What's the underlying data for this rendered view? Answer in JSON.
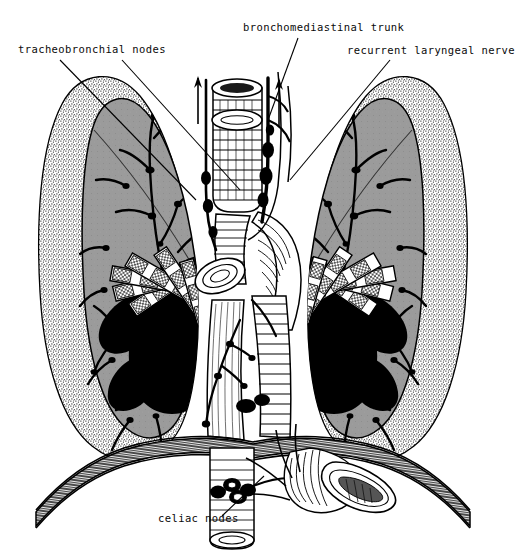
{
  "figure": {
    "kind": "anatomical-line-illustration",
    "view": "anterior coronal section of the thorax",
    "style": "black-and-white pen-and-ink stipple engraving"
  },
  "labels": {
    "tracheobronchial_nodes": "tracheobronchial nodes",
    "bronchomediastinal_trunk": "bronchomediastinal trunk",
    "recurrent_laryngeal_nerve": "recurrent laryngeal nerve",
    "celiac_nodes": "celiac nodes"
  },
  "colors": {
    "ink": "#000000",
    "paper": "#ffffff",
    "lung_parenchyma": "#9b9b9b",
    "lung_parenchyma_shadow": "#8a8a8a",
    "stipple_rim": "#ffffff",
    "node_black": "#000000",
    "vessel_white": "#ffffff"
  },
  "structures": {
    "left_lung": "left lung, stippled pleural rim with gray parenchyma and dark lymphatic plexus",
    "right_lung": "right lung, stippled pleural rim with gray parenchyma and dark lymphatic plexus",
    "trachea": "trachea with horizontal cartilage rings",
    "aortic_arch": "aortic arch and great vessels",
    "descending_aorta": "descending thoracic aorta",
    "esophagus": "esophagus with longitudinal striations",
    "hilum_left": "left pulmonary hilum, black nodal mass with radiating banded bronchi",
    "hilum_right": "right pulmonary hilum, black nodal mass with radiating banded bronchi",
    "diaphragm": "diaphragm drawn as hatched curved band",
    "cisterna_chyli": "cisterna chyli and abdominal lymphatics below the diaphragm",
    "celiac_trunk": "celiac trunk with clustered black celiac nodes"
  },
  "signature": "WB"
}
